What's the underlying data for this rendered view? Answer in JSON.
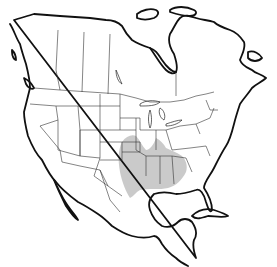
{
  "map": {
    "region": "North America",
    "type": "species range map",
    "colors": {
      "background": "#ffffff",
      "outline": "#111111",
      "borders": "#333333",
      "range_fill": "#c4c4c4"
    },
    "range": {
      "label": "",
      "description": "Shaded range across south-central and southeastern United States"
    }
  }
}
